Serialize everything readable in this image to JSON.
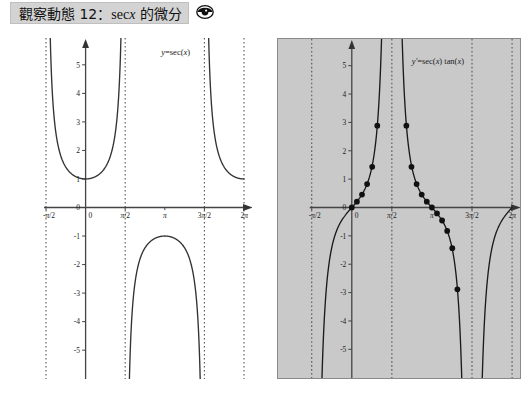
{
  "header": {
    "title_prefix": "觀察動態 12",
    "title_colon": "：",
    "title_fn": "sec",
    "title_var": "x",
    "title_suffix": " 的微分",
    "icon": "eye-icon",
    "background": "#d3d3d3"
  },
  "chart_data": [
    {
      "id": "sec-graph",
      "type": "line",
      "title": "",
      "annotation": "y = sec(x)",
      "annotation_parts": {
        "lhs": "y",
        "eq": "=",
        "rhs": "sec(x)"
      },
      "xlabel": "",
      "ylabel": "",
      "xlim": [
        -1.5707963,
        6.2831853
      ],
      "ylim": [
        -5.8,
        5.8
      ],
      "xticks": [
        -1.5707963,
        0,
        1.5707963,
        3.1415927,
        4.712389,
        6.2831853
      ],
      "xticklabels": [
        "-π/2",
        "0",
        "π/2",
        "π",
        "3π/2",
        "2π"
      ],
      "yticks": [
        -5,
        -4,
        -3,
        -2,
        -1,
        0,
        1,
        2,
        3,
        4,
        5
      ],
      "yticklabels": [
        "-5",
        "-4",
        "-3",
        "-2",
        "-1",
        "0",
        "1",
        "2",
        "3",
        "4",
        "5"
      ],
      "asymptotes": [
        -1.5707963,
        1.5707963,
        4.712389,
        6.2831853
      ],
      "asymptote_style": "dotted",
      "grid": false,
      "legend": "none",
      "background": "#ffffff",
      "series": [
        {
          "name": "y = sec(x)",
          "expr": "sec",
          "color": "#333333"
        }
      ]
    },
    {
      "id": "sec-tan-graph",
      "type": "line",
      "title": "",
      "annotation": "y' = sec(x) tan(x)",
      "annotation_parts": {
        "lhs": "y'",
        "eq": "=",
        "rhs": "sec(x) tan(x)"
      },
      "xlabel": "",
      "ylabel": "",
      "xlim": [
        -1.5707963,
        6.2831853
      ],
      "ylim": [
        -5.8,
        5.8
      ],
      "xticks": [
        -1.5707963,
        0,
        1.5707963,
        3.1415927,
        4.712389,
        6.2831853
      ],
      "xticklabels": [
        "-π/2",
        "0",
        "π/2",
        "π",
        "3π/2",
        "2π"
      ],
      "yticks": [
        -5,
        -4,
        -3,
        -2,
        -1,
        0,
        1,
        2,
        3,
        4,
        5
      ],
      "yticklabels": [
        "-5",
        "-4",
        "-3",
        "-2",
        "-1",
        "0",
        "1",
        "2",
        "3",
        "4",
        "5"
      ],
      "asymptotes": [
        -1.5707963,
        1.5707963,
        4.712389,
        6.2831853
      ],
      "asymptote_style": "dotted",
      "grid": false,
      "legend": "none",
      "background": "#c9c9c9",
      "series": [
        {
          "name": "y' = sec(x) tan(x)",
          "expr": "sec*tan",
          "color": "#1a1a1a"
        }
      ],
      "points": [
        {
          "x": 0.0,
          "y": 0.0
        },
        {
          "x": 0.2,
          "y": 0.207
        },
        {
          "x": 0.4,
          "y": 0.458
        },
        {
          "x": 0.6,
          "y": 0.825
        },
        {
          "x": 0.8,
          "y": 1.433
        },
        {
          "x": 1.0,
          "y": 2.884
        },
        {
          "x": 1.2,
          "y": 7.04
        },
        {
          "x": 1.94,
          "y": 7.04
        },
        {
          "x": 2.14,
          "y": 2.884
        },
        {
          "x": 2.34,
          "y": 1.433
        },
        {
          "x": 2.54,
          "y": 0.825
        },
        {
          "x": 2.74,
          "y": 0.458
        },
        {
          "x": 2.94,
          "y": 0.207
        },
        {
          "x": 3.14,
          "y": 0.0
        },
        {
          "x": 3.34,
          "y": -0.207
        },
        {
          "x": 3.54,
          "y": -0.458
        },
        {
          "x": 3.74,
          "y": -0.825
        },
        {
          "x": 3.94,
          "y": -1.433
        },
        {
          "x": 4.14,
          "y": -2.884
        }
      ],
      "point_marker": "filled-circle",
      "point_color": "#111111"
    }
  ]
}
